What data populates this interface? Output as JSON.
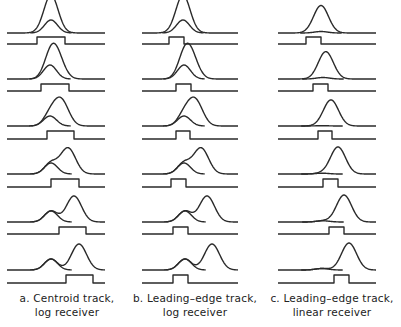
{
  "figure": {
    "stroke_color": "#2a2a2a",
    "rows": [
      {
        "baseline_y": 33,
        "gate_base_y": 44,
        "gate_top_y": 37
      },
      {
        "baseline_y": 79,
        "gate_base_y": 91,
        "gate_top_y": 84
      },
      {
        "baseline_y": 126,
        "gate_base_y": 139,
        "gate_top_y": 131
      },
      {
        "baseline_y": 174,
        "gate_base_y": 187,
        "gate_top_y": 179
      },
      {
        "baseline_y": 222,
        "gate_base_y": 234,
        "gate_top_y": 227
      },
      {
        "baseline_y": 270,
        "gate_base_y": 283,
        "gate_top_y": 275
      }
    ],
    "columns": [
      {
        "id": "a",
        "caption_line1": "a. Centroid track,",
        "caption_line2": "log receiver",
        "caption_x": 0,
        "x_start": 7,
        "x_end": 105,
        "sigma_big": 7.5,
        "sigma_small": 6.5,
        "overlay_style": "separate-first",
        "panels": [
          {
            "big_x": 51,
            "big_h": 25,
            "small_x": 51,
            "small_h": 13,
            "gate": [
              37,
              65
            ]
          },
          {
            "big_x": 56,
            "big_h": 25,
            "small_x": 50,
            "small_h": 14,
            "gate": [
              41,
              69
            ]
          },
          {
            "big_x": 61,
            "big_h": 26,
            "small_x": 50,
            "small_h": 10,
            "gate": [
              47,
              74
            ]
          },
          {
            "big_x": 68,
            "big_h": 26,
            "small_x": 51,
            "small_h": 11,
            "gate": [
              51,
              79
            ]
          },
          {
            "big_x": 74,
            "big_h": 26,
            "small_x": 51,
            "small_h": 11,
            "gate": [
              59,
              86
            ]
          },
          {
            "big_x": 79,
            "big_h": 26,
            "small_x": 51,
            "small_h": 11,
            "gate": [
              66,
              93
            ]
          }
        ]
      },
      {
        "id": "b",
        "caption_line1": "b. Leading–edge track,",
        "caption_line2": "log receiver",
        "caption_x": 128,
        "x_start": 142,
        "x_end": 238,
        "sigma_big": 7.5,
        "sigma_small": 6.5,
        "overlay_style": "separate-first",
        "panels": [
          {
            "big_x": 183,
            "big_h": 25,
            "small_x": 183,
            "small_h": 13,
            "gate": [
              169,
              184
            ]
          },
          {
            "big_x": 190,
            "big_h": 25,
            "small_x": 184,
            "small_h": 14,
            "gate": [
              176,
              191
            ]
          },
          {
            "big_x": 195,
            "big_h": 26,
            "small_x": 184,
            "small_h": 10,
            "gate": [
              176,
              190
            ]
          },
          {
            "big_x": 201,
            "big_h": 26,
            "small_x": 184,
            "small_h": 11,
            "gate": [
              171,
              186
            ]
          },
          {
            "big_x": 207,
            "big_h": 26,
            "small_x": 185,
            "small_h": 11,
            "gate": [
              173,
              188
            ]
          },
          {
            "big_x": 212,
            "big_h": 26,
            "small_x": 185,
            "small_h": 11,
            "gate": [
              173,
              188
            ]
          }
        ]
      },
      {
        "id": "c",
        "caption_line1": "c. Leading–edge track,",
        "caption_line2": "linear receiver",
        "caption_x": 265,
        "x_start": 278,
        "x_end": 376,
        "sigma_big": 7.5,
        "sigma_small": 6.5,
        "overlay_style": "separate-first",
        "panels": [
          {
            "big_x": 321,
            "big_h": 26,
            "small_x": 321,
            "small_h": 1.5,
            "gate": [
              306,
              321
            ]
          },
          {
            "big_x": 326,
            "big_h": 26,
            "small_x": 323,
            "small_h": 1.5,
            "gate": [
              313,
              328
            ]
          },
          {
            "big_x": 331,
            "big_h": 26,
            "small_x": 322,
            "small_h": 0.3,
            "gate": [
              318,
              332
            ]
          },
          {
            "big_x": 338,
            "big_h": 27,
            "small_x": 322,
            "small_h": 0.8,
            "gate": [
              323,
              338
            ]
          },
          {
            "big_x": 344,
            "big_h": 27,
            "small_x": 323,
            "small_h": 1.2,
            "gate": [
              329,
              344
            ]
          },
          {
            "big_x": 349,
            "big_h": 27,
            "small_x": 322,
            "small_h": 1.5,
            "gate": [
              334,
              349
            ]
          }
        ]
      }
    ]
  }
}
